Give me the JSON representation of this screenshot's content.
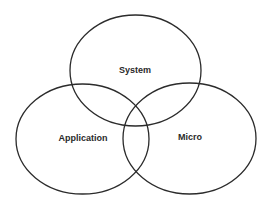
{
  "diagram": {
    "type": "venn",
    "background": "#ffffff",
    "stroke_color": "#2b2b2b",
    "text_color": "#2a2a2a",
    "sets": [
      {
        "id": "system",
        "label": "System",
        "cx": 135.5,
        "cy": 70.5,
        "rx": 65.5,
        "ry": 55.5,
        "label_x": 135,
        "label_y": 71
      },
      {
        "id": "application",
        "label": "Application",
        "cx": 82.5,
        "cy": 139,
        "rx": 66.5,
        "ry": 55,
        "label_x": 83,
        "label_y": 139
      },
      {
        "id": "micro",
        "label": "Micro",
        "cx": 189.5,
        "cy": 138.5,
        "rx": 66.5,
        "ry": 55.5,
        "label_x": 190,
        "label_y": 138
      }
    ]
  }
}
